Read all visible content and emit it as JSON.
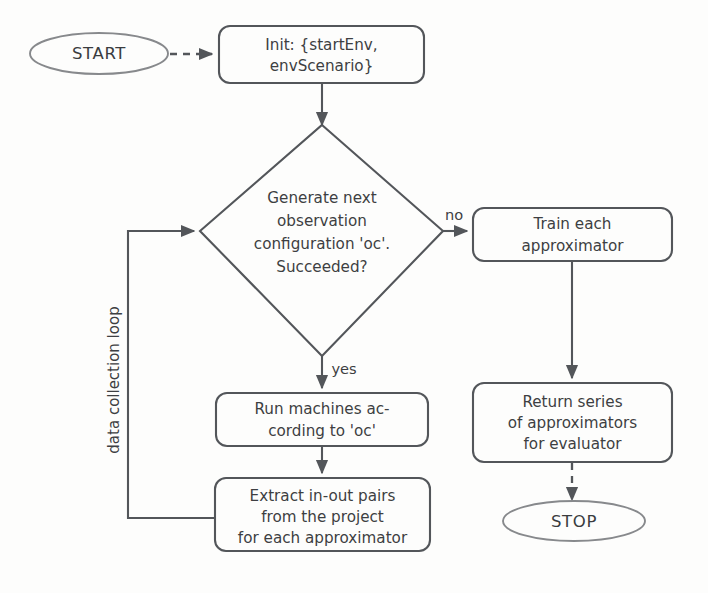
{
  "diagram": {
    "colors": {
      "background": "#fdfdfc",
      "line": "#53565a",
      "terminator_line": "#87898c",
      "text": "#3d3f42"
    },
    "nodes": {
      "start": {
        "label": "START",
        "shape": "ellipse"
      },
      "init": {
        "shape": "rounded-rect",
        "lines": [
          "Init: {startEnv,",
          "envScenario}"
        ]
      },
      "decision": {
        "shape": "diamond",
        "lines": [
          "Generate next",
          "observation",
          "configuration 'oc'.",
          "Succeeded?"
        ]
      },
      "train": {
        "shape": "rounded-rect",
        "lines": [
          "Train each",
          "approximator"
        ]
      },
      "return_series": {
        "shape": "rounded-rect",
        "lines": [
          "Return series",
          "of approximators",
          "for evaluator"
        ]
      },
      "run_machines": {
        "shape": "rounded-rect",
        "lines": [
          "Run machines ac-",
          "cording to 'oc'"
        ]
      },
      "extract": {
        "shape": "rounded-rect",
        "lines": [
          "Extract in-out pairs",
          "from the project",
          "for each approximator"
        ]
      },
      "stop": {
        "label": "STOP",
        "shape": "ellipse"
      }
    },
    "edges": {
      "start_to_init": {
        "style": "dashed",
        "label": ""
      },
      "init_to_decision": {
        "style": "solid",
        "label": ""
      },
      "decision_to_train": {
        "style": "solid",
        "label": "no"
      },
      "decision_to_run": {
        "style": "solid",
        "label": "yes"
      },
      "train_to_return": {
        "style": "solid",
        "label": ""
      },
      "return_to_stop": {
        "style": "dashed",
        "label": ""
      },
      "run_to_extract": {
        "style": "solid",
        "label": ""
      },
      "loop_back": {
        "style": "solid",
        "label": "data collection loop"
      }
    }
  }
}
